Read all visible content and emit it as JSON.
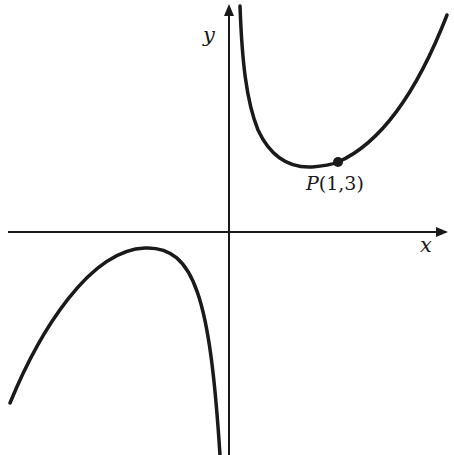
{
  "figure": {
    "type": "function-graph",
    "axes": {
      "x_label": "x",
      "y_label": "y"
    },
    "point": {
      "name": "P",
      "coords": "(1,3)",
      "x": 1,
      "y": 3
    },
    "branches": [
      {
        "name": "right-branch",
        "description": "x>0: descends from +infinity near y-axis to a minimum, passes through P(1,3), rises"
      },
      {
        "name": "left-branch",
        "description": "x<0: rises to a local maximum below the x-axis, then falls to -infinity near y-axis"
      }
    ],
    "colors": {
      "stroke": "#1a1a1a",
      "background": "#ffffff"
    }
  }
}
